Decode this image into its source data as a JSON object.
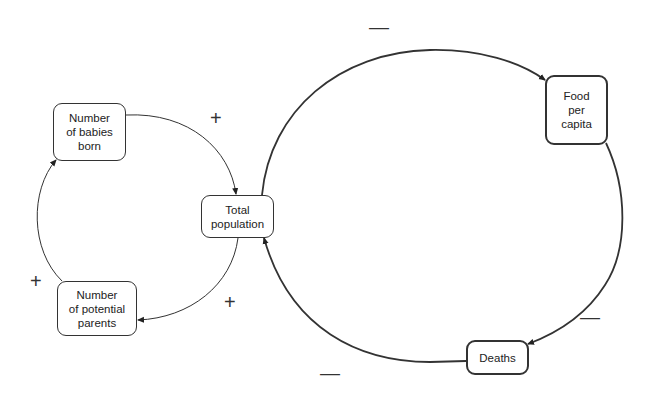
{
  "nodes": {
    "babies": "Number\nof babies\nborn",
    "total": "Total\npopulation",
    "parents": "Number\nof potential\nparents",
    "food": "Food\nper\ncapita",
    "deaths": "Deaths"
  },
  "signs": {
    "babies_to_total": "+",
    "total_to_parents": "+",
    "parents_to_babies": "+",
    "total_to_food": "—",
    "food_to_deaths": "—",
    "deaths_to_total": "—"
  }
}
